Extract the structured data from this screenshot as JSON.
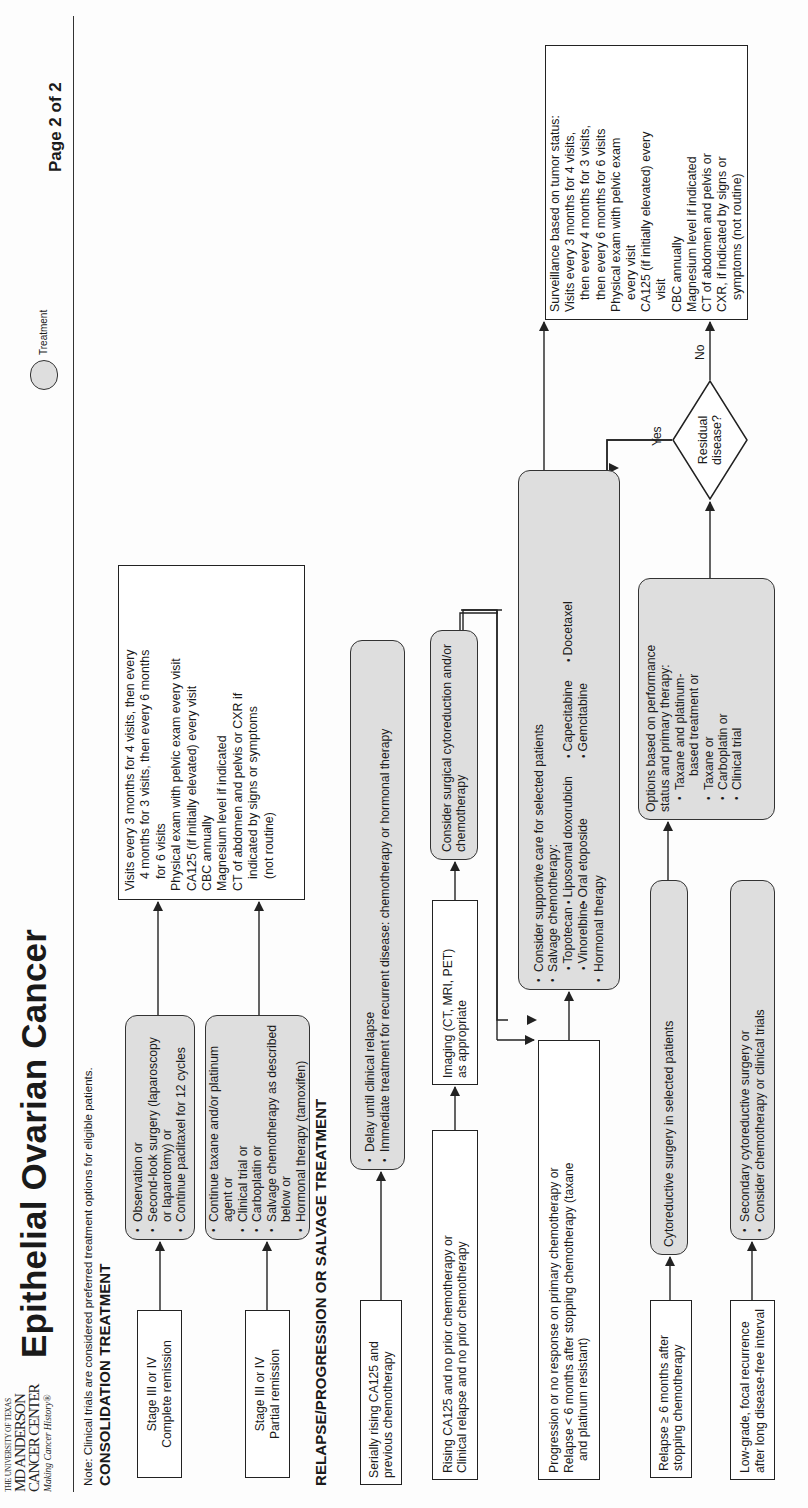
{
  "header": {
    "logo": {
      "line1": "THE UNIVERSITY OF TEXAS",
      "line2": "MD ANDERSON",
      "line3": "CANCER CENTER",
      "tagline": "Making Cancer History®"
    },
    "title": "Epithelial Ovarian Cancer",
    "legend": {
      "shape": "rounded-pill",
      "label": "Treatment",
      "fill": "#dedede"
    },
    "page_indicator": "Page 2 of 2",
    "note": "Note: Clinical trials are considered preferred treatment options for eligible patients."
  },
  "sections": {
    "consolidation": "CONSOLIDATION TREATMENT",
    "relapse": "RELAPSE/PROGRESSION OR SALVAGE TREATMENT"
  },
  "consolidation": {
    "complete": {
      "condition": [
        "Stage III or IV",
        "Complete remission"
      ],
      "treatment": [
        "Observation or",
        "Second-look surgery (laparoscopy or laparotomy) or",
        "Continue paclitaxel for 12 cycles"
      ]
    },
    "partial": {
      "condition": [
        "Stage III or IV",
        "Partial remission"
      ],
      "treatment": [
        "Continue taxane and/or platinum agent or",
        "Clinical trial or",
        "Carboplatin or",
        "Salvage chemotherapy as described below or",
        "Hormonal therapy (tamoxifen)"
      ]
    },
    "surveillance": [
      "Visits every 3 months for 4 visits, then every",
      "4 months for 3 visits, then every 6 months",
      "for 6 visits",
      "Physical exam with pelvic exam every visit",
      "CA125 (if initially elevated) every visit",
      "CBC annually",
      "Magnesium level if indicated",
      "CT of abdomen and pelvis or CXR if",
      "indicated by signs or symptoms",
      "(not routine)"
    ]
  },
  "relapse": {
    "serially_rising": {
      "condition": [
        "Serially rising CA125 and",
        "previous chemotherapy"
      ],
      "treatment": [
        "Delay until clinical relapse",
        "Immediate treatment for recurrent disease: chemotherapy or hormonal therapy"
      ]
    },
    "no_prior": {
      "condition": [
        "Rising CA125 and no prior chemotherapy or",
        "Clinical relapse and no prior chemotherapy"
      ],
      "imaging": [
        "Imaging (CT, MRI, PET)",
        "as appropriate"
      ],
      "treatment": [
        "Consider surgical cytoreduction and/or",
        "chemotherapy"
      ]
    },
    "progression": {
      "condition": [
        "Progression or no response on primary chemotherapy or",
        "Relapse < 6 months after stopping chemotherapy (taxane",
        "and platinum resistant)"
      ],
      "treatment": {
        "items": [
          "Consider supportive care for selected patients",
          "Salvage chemotherapy:"
        ],
        "drugs_row1": [
          "Topotecan",
          "Liposomal doxorubicin",
          "Capecitabine",
          "Docetaxel"
        ],
        "drugs_row2": [
          "Vinorelbine",
          "Oral etoposide",
          "Gemcitabine"
        ],
        "last_item": "Hormonal therapy"
      }
    },
    "late_relapse": {
      "condition": [
        "Relapse ≥ 6 months after",
        "stopping chemotherapy"
      ],
      "surgery": "Cytoreductive surgery in selected patients",
      "options": {
        "intro": [
          "Options based on performance",
          "status and primary therapy:"
        ],
        "items": [
          "Taxane and platinum-",
          "based treatment or",
          "Taxane or",
          "Carboplatin or",
          "Clinical trial"
        ]
      },
      "decision": {
        "label": [
          "Residual",
          "disease?"
        ],
        "yes": "Yes",
        "no": "No"
      }
    },
    "low_grade": {
      "condition": [
        "Low-grade, focal recurrence",
        "after long disease-free interval"
      ],
      "treatment": [
        "Secondary cytoreductive surgery or",
        "Consider chemotherapy or clinical trials"
      ]
    },
    "surveillance": [
      "Surveillance based on tumor status:",
      "Visits every 3 months for 4 visits,",
      "then every 4 months for 3 visits,",
      "then every 6 months for 6 visits",
      "Physical exam with pelvic exam",
      "every visit",
      "CA125 (if initially elevated) every",
      "visit",
      "CBC annually",
      "Magnesium level if indicated",
      "CT of abdomen and pelvis or",
      "CXR, if indicated by signs or",
      "symptoms (not routine)"
    ]
  },
  "colors": {
    "treatment_fill": "#dedede",
    "line": "#222222",
    "background": "#fdfdfd"
  }
}
